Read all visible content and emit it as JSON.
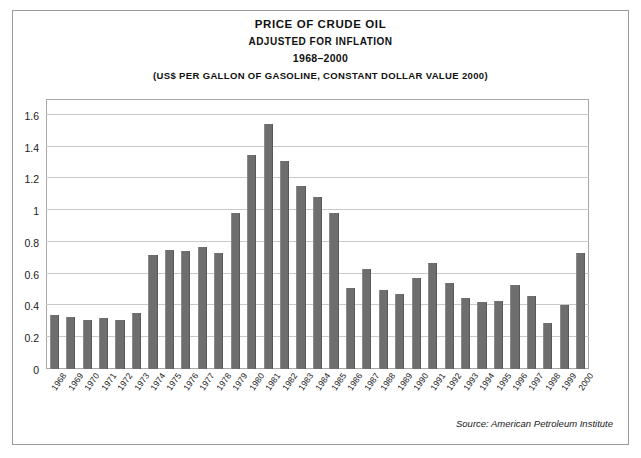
{
  "figure": {
    "title": "Price of Crude Oil",
    "subtitle": "Adjusted for Inflation",
    "year_range": "1968–2000",
    "units_note": "(US$ per gallon of gasoline, constant dollar value 2000)",
    "source": "Source: American Petroleum Institute",
    "bar_color": "#6e6e6e",
    "gridline_color": "#c9c9c9",
    "frame_color": "#9a9a9a"
  },
  "chart_data": {
    "type": "bar",
    "title": "Price of Crude Oil Adjusted for Inflation 1968–2000",
    "subtitle": "(US$ per gallon of gasoline, constant dollar value 2000)",
    "xlabel": "",
    "ylabel": "",
    "ylim": [
      0,
      1.7
    ],
    "yticks": [
      0.2,
      0.4,
      0.6,
      0.8,
      1,
      1.2,
      1.4,
      1.6
    ],
    "ytick_labels": [
      "0.2",
      "0.4",
      "0.6",
      "0.8",
      "1",
      "1.2",
      "1.4",
      "1.6"
    ],
    "grid": true,
    "legend": "none",
    "categories": [
      "1968",
      "1969",
      "1970",
      "1971",
      "1972",
      "1973",
      "1974",
      "1975",
      "1976",
      "1977",
      "1978",
      "1979",
      "1980",
      "1981",
      "1982",
      "1983",
      "1984",
      "1985",
      "1986",
      "1987",
      "1988",
      "1989",
      "1990",
      "1991",
      "1992",
      "1993",
      "1994",
      "1995",
      "1996",
      "1997",
      "1998",
      "1999",
      "2000"
    ],
    "values": [
      0.34,
      0.33,
      0.31,
      0.32,
      0.31,
      0.35,
      0.72,
      0.75,
      0.74,
      0.77,
      0.73,
      0.98,
      1.35,
      1.54,
      1.31,
      1.15,
      1.08,
      0.98,
      0.51,
      0.63,
      0.5,
      0.47,
      0.57,
      0.67,
      0.54,
      0.45,
      0.42,
      0.43,
      0.53,
      0.46,
      0.29,
      0.4,
      0.73
    ],
    "series": [
      {
        "name": "Price of crude oil (US$ per gallon of gasoline, constant 2000 dollars)",
        "values": [
          0.34,
          0.33,
          0.31,
          0.32,
          0.31,
          0.35,
          0.72,
          0.75,
          0.74,
          0.77,
          0.73,
          0.98,
          1.35,
          1.54,
          1.31,
          1.15,
          1.08,
          0.98,
          0.51,
          0.63,
          0.5,
          0.47,
          0.57,
          0.67,
          0.54,
          0.45,
          0.42,
          0.43,
          0.53,
          0.46,
          0.29,
          0.4,
          0.73
        ]
      }
    ]
  }
}
